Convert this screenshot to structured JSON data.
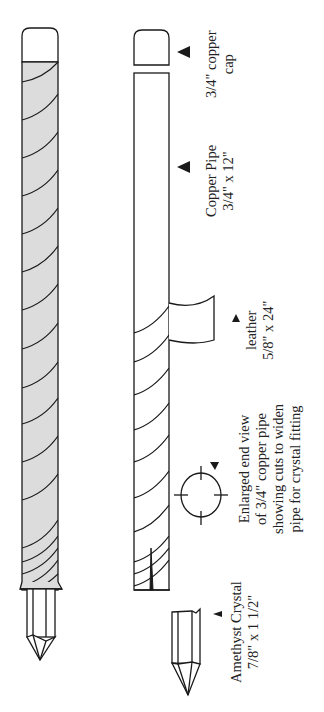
{
  "diagram": {
    "colors": {
      "stroke": "#1a1a1a",
      "shade": "#dcdcdc",
      "background": "#ffffff"
    },
    "labels": {
      "cap": {
        "line1": "3/4\" copper",
        "line2": "cap"
      },
      "pipe": {
        "line1": "Copper Pipe",
        "line2": "3/4\" x 12\""
      },
      "leather": {
        "line1": "leather",
        "line2": "5/8\" x 24\""
      },
      "end_view": {
        "line1": "Enlarged end view",
        "line2": "of 3/4\" copper pipe",
        "line3": "showing cuts to widen",
        "line4": "pipe for crystal fitting"
      },
      "crystal": {
        "line1": "Amethyst Crystal",
        "line2": "7/8\" x 1 1/2\""
      }
    },
    "parts": [
      {
        "id": "assembled-wand",
        "components": [
          "copper cap",
          "leather-wrapped copper pipe",
          "amethyst crystal"
        ]
      },
      {
        "id": "exploded-view",
        "components": [
          "copper cap",
          "copper pipe",
          "leather strip",
          "end view of pipe",
          "amethyst crystal"
        ]
      }
    ]
  }
}
